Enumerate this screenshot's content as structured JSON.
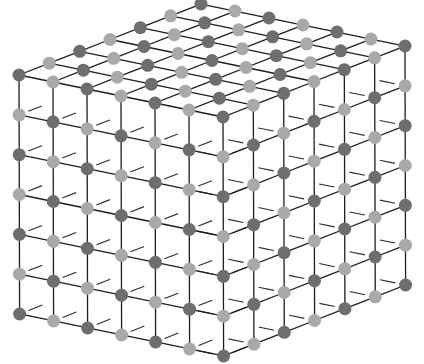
{
  "diagram": {
    "type": "cubic-crystal-lattice",
    "nodes_per_edge": 7,
    "origin_front_top_corner": [
      223,
      117
    ],
    "step_left": [
      -34.0,
      -7.0
    ],
    "step_right": [
      30.33,
      -11.83
    ],
    "step_down": [
      0.1,
      39.83
    ],
    "node_radius": 6.5,
    "colors": {
      "dark_atom": "#6e6e6e",
      "light_atom": "#a9a9a9",
      "bond": "#1e1e1e",
      "background": "#ffffff"
    },
    "parity_dark": 0
  }
}
